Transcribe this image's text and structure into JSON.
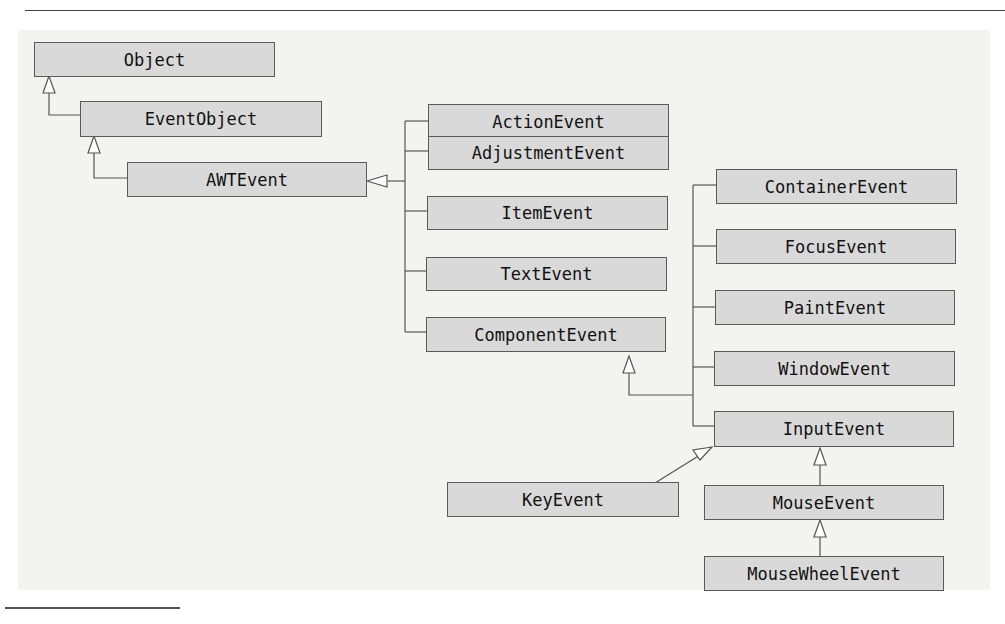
{
  "diagram": {
    "classes": {
      "object": "Object",
      "event_object": "EventObject",
      "awt_event": "AWTEvent",
      "action_event": "ActionEvent",
      "adjustment_event": "AdjustmentEvent",
      "item_event": "ItemEvent",
      "text_event": "TextEvent",
      "component_event": "ComponentEvent",
      "container_event": "ContainerEvent",
      "focus_event": "FocusEvent",
      "paint_event": "PaintEvent",
      "window_event": "WindowEvent",
      "input_event": "InputEvent",
      "key_event": "KeyEvent",
      "mouse_event": "MouseEvent",
      "mouse_wheel_event": "MouseWheelEvent"
    },
    "inheritance": [
      {
        "child": "EventObject",
        "parent": "Object"
      },
      {
        "child": "AWTEvent",
        "parent": "EventObject"
      },
      {
        "child": "ActionEvent",
        "parent": "AWTEvent"
      },
      {
        "child": "AdjustmentEvent",
        "parent": "AWTEvent"
      },
      {
        "child": "ItemEvent",
        "parent": "AWTEvent"
      },
      {
        "child": "TextEvent",
        "parent": "AWTEvent"
      },
      {
        "child": "ComponentEvent",
        "parent": "AWTEvent"
      },
      {
        "child": "ContainerEvent",
        "parent": "ComponentEvent"
      },
      {
        "child": "FocusEvent",
        "parent": "ComponentEvent"
      },
      {
        "child": "PaintEvent",
        "parent": "ComponentEvent"
      },
      {
        "child": "WindowEvent",
        "parent": "ComponentEvent"
      },
      {
        "child": "InputEvent",
        "parent": "ComponentEvent"
      },
      {
        "child": "KeyEvent",
        "parent": "InputEvent"
      },
      {
        "child": "MouseEvent",
        "parent": "InputEvent"
      },
      {
        "child": "MouseWheelEvent",
        "parent": "MouseEvent"
      }
    ],
    "colors": {
      "box_fill": "#d9d9d9",
      "box_border": "#5a5a5a",
      "panel": "#f3f3f1",
      "line": "#555555"
    }
  }
}
